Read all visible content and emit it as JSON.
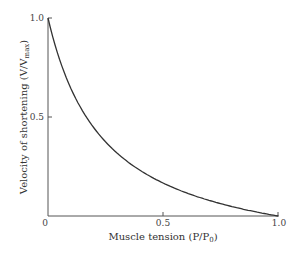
{
  "chart_data": {
    "type": "line",
    "title": "",
    "xlabel": "Muscle tension (P/P0)",
    "ylabel": "Velocity of shortening (V/Vmax)",
    "xlim": [
      0,
      1.0
    ],
    "ylim": [
      0,
      1.0
    ],
    "x_ticks": [
      "0",
      "0.5",
      "1.0"
    ],
    "y_ticks": [
      "0.5",
      "1.0"
    ],
    "grid": false,
    "legend": null,
    "series": [
      {
        "name": "Force-velocity curve",
        "x": [
          0.0,
          0.05,
          0.1,
          0.15,
          0.2,
          0.25,
          0.3,
          0.4,
          0.5,
          0.6,
          0.7,
          0.8,
          0.9,
          1.0
        ],
        "y": [
          1.0,
          0.81,
          0.66,
          0.55,
          0.46,
          0.39,
          0.33,
          0.24,
          0.17,
          0.12,
          0.08,
          0.05,
          0.02,
          0.0
        ]
      }
    ]
  },
  "labels": {
    "x_axis": "Muscle tension (P/P",
    "x_axis_sub": "0",
    "x_axis_close": ")",
    "y_axis": "Velocity of shortening (V/V",
    "y_axis_sub": "max",
    "y_axis_close": ")",
    "tick_x0": "0",
    "tick_x05": "0.5",
    "tick_x1": "1.0",
    "tick_y05": "0.5",
    "tick_y1": "1.0"
  }
}
